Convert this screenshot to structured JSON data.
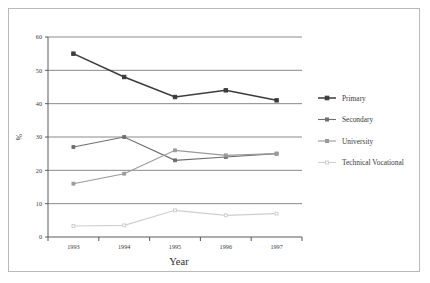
{
  "chart_data": {
    "type": "line",
    "title": "",
    "xlabel": "Year",
    "ylabel": "%",
    "categories": [
      "1993",
      "1994",
      "1995",
      "1996",
      "1997"
    ],
    "x": [
      1993,
      1994,
      1995,
      1996,
      1997
    ],
    "ylim": [
      0,
      60
    ],
    "yticks": [
      0,
      10,
      20,
      30,
      40,
      50,
      60
    ],
    "ytick_labels": [
      "0",
      "10",
      "20",
      "30",
      "40",
      "50",
      "60"
    ],
    "grid": "horizontal",
    "legend_position": "right",
    "series": [
      {
        "name": "Primary",
        "values": [
          55,
          48,
          42,
          44,
          41
        ],
        "color": "#3b3b3b",
        "marker": "square"
      },
      {
        "name": "Secondary",
        "values": [
          27,
          30,
          23,
          24,
          25
        ],
        "color": "#6e6e6e",
        "marker": "square"
      },
      {
        "name": "University",
        "values": [
          16,
          19,
          26,
          24.5,
          25
        ],
        "color": "#9a9a9a",
        "marker": "square"
      },
      {
        "name": "Technical Vocational",
        "values": [
          3.3,
          3.5,
          8,
          6.5,
          7
        ],
        "color": "#cfcfcf",
        "marker": "square"
      }
    ]
  },
  "axes": {
    "x_title": "Year",
    "y_title": "%"
  },
  "legend": {
    "items": [
      {
        "label": "Primary"
      },
      {
        "label": "Secondary"
      },
      {
        "label": "University"
      },
      {
        "label": "Technical Vocational"
      }
    ]
  }
}
